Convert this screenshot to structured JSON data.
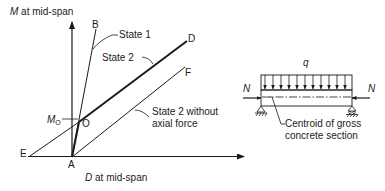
{
  "graph": {
    "y_axis_label": {
      "var": "M",
      "rest": " at mid-span"
    },
    "x_axis_label": {
      "var": "D",
      "rest": " at mid-span"
    },
    "points": {
      "A": "A",
      "B": "B",
      "D": "D",
      "E": "E",
      "F": "F",
      "O": "O"
    },
    "mo_label": {
      "main": "M",
      "sub": "O"
    },
    "annotations": {
      "state1": "State 1",
      "state2": "State 2",
      "state2_no_axial_line1": "State 2 without",
      "state2_no_axial_line2": "axial force"
    }
  },
  "beam": {
    "load_label": "q",
    "axial_left": "N",
    "axial_right": "N",
    "centroid_line1": "Centroid of gross",
    "centroid_line2": "concrete section"
  },
  "colors": {
    "ink": "#1a1a1a",
    "background": "#ffffff"
  }
}
